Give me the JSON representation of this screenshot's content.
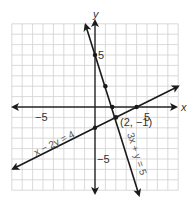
{
  "graph": {
    "title": "",
    "grid": {
      "xmin": -8,
      "xmax": 8,
      "ymin": -8,
      "ymax": 8,
      "step": 1
    },
    "axes": {
      "x_label": "x",
      "y_label": "y"
    },
    "ticks": {
      "x_neg": "−5",
      "x_pos": "5",
      "y_pos": "5",
      "y_neg": "−5"
    },
    "lines": [
      {
        "equation": "x − 2y = 4",
        "label": "x − 2y = 4"
      },
      {
        "equation": "3x + y = 5",
        "label": "3x + y = 5"
      }
    ],
    "solution_point": {
      "x": 2,
      "y": -1,
      "label": "(2, −1)"
    },
    "colors": {
      "grid": "#cfcfcf",
      "axis": "#222222",
      "line": "#1a1a1a",
      "text": "#333333"
    }
  }
}
